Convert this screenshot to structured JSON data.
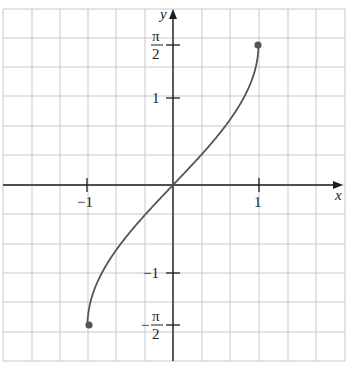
{
  "chart_data": {
    "type": "line",
    "title": "",
    "function": "y = arcsin(x)",
    "xlabel": "x",
    "ylabel": "y",
    "xlim": [
      -2,
      2
    ],
    "ylim": [
      -2,
      2
    ],
    "grid": true,
    "x_ticks": [
      {
        "value": -1,
        "label": "−1"
      },
      {
        "value": 1,
        "label": "1"
      }
    ],
    "y_ticks": [
      {
        "value": 1.5708,
        "label_num": "π",
        "label_den": "2",
        "sign": ""
      },
      {
        "value": 1,
        "label": "1"
      },
      {
        "value": -1,
        "label": "−1"
      },
      {
        "value": -1.5708,
        "label_num": "π",
        "label_den": "2",
        "sign": "−"
      }
    ],
    "series": [
      {
        "name": "arcsin(x)",
        "x": [
          -1,
          -0.9,
          -0.75,
          -0.5,
          -0.25,
          0,
          0.25,
          0.5,
          0.75,
          0.9,
          1
        ],
        "y": [
          -1.5708,
          -1.1198,
          -0.8481,
          -0.5236,
          -0.2527,
          0,
          0.2527,
          0.5236,
          0.8481,
          1.1198,
          1.5708
        ]
      }
    ],
    "endpoints": [
      {
        "x": -1,
        "y": -1.5708,
        "filled": true
      },
      {
        "x": 1,
        "y": 1.5708,
        "filled": true
      }
    ]
  },
  "labels": {
    "x_axis": "x",
    "y_axis": "y",
    "x_tick_neg1": "−1",
    "x_tick_1": "1",
    "y_tick_1": "1",
    "y_tick_neg1": "−1",
    "pi": "π",
    "two": "2",
    "minus": "−"
  },
  "colors": {
    "grid": "#c9c9c9",
    "axis": "#1e1e1e",
    "curve": "#555555"
  }
}
